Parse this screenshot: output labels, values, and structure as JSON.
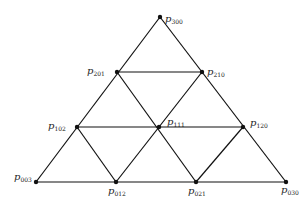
{
  "diagram": {
    "points": [
      {
        "id": "p300",
        "symbol": "p",
        "index": "300",
        "x": 160,
        "y": 17,
        "lx": 165,
        "ly": 21
      },
      {
        "id": "p201",
        "symbol": "p",
        "index": "201",
        "x": 117,
        "y": 72,
        "lx": 87,
        "ly": 72
      },
      {
        "id": "p210",
        "symbol": "p",
        "index": "210",
        "x": 202,
        "y": 72,
        "lx": 207,
        "ly": 73
      },
      {
        "id": "p102",
        "symbol": "p",
        "index": "102",
        "x": 77,
        "y": 127,
        "lx": 48,
        "ly": 128
      },
      {
        "id": "p111",
        "symbol": "p",
        "index": "111",
        "x": 159,
        "y": 127,
        "lx": 167,
        "ly": 124
      },
      {
        "id": "p120",
        "symbol": "p",
        "index": "120",
        "x": 243,
        "y": 127,
        "lx": 251,
        "ly": 125
      },
      {
        "id": "p003",
        "symbol": "p",
        "index": "003",
        "x": 36,
        "y": 182,
        "lx": 14,
        "ly": 179
      },
      {
        "id": "p012",
        "symbol": "p",
        "index": "012",
        "x": 116,
        "y": 182,
        "lx": 108,
        "ly": 194
      },
      {
        "id": "p021",
        "symbol": "p",
        "index": "021",
        "x": 196,
        "y": 182,
        "lx": 188,
        "ly": 194
      },
      {
        "id": "p030",
        "symbol": "p",
        "index": "030",
        "x": 286,
        "y": 182,
        "lx": 282,
        "ly": 193
      }
    ],
    "labels": {
      "p300": "p",
      "p300_sub": "300",
      "p201": "p",
      "p201_sub": "201",
      "p210": "p",
      "p210_sub": "210",
      "p102": "p",
      "p102_sub": "102",
      "p111": "p",
      "p111_sub": "111",
      "p120": "p",
      "p120_sub": "120",
      "p003": "p",
      "p003_sub": "003",
      "p012": "p",
      "p012_sub": "012",
      "p021": "p",
      "p021_sub": "021",
      "p030": "p",
      "p030_sub": "030"
    },
    "edges": [
      [
        "p300",
        "p201"
      ],
      [
        "p201",
        "p102"
      ],
      [
        "p102",
        "p003"
      ],
      [
        "p300",
        "p210"
      ],
      [
        "p210",
        "p120"
      ],
      [
        "p120",
        "p030"
      ],
      [
        "p003",
        "p012"
      ],
      [
        "p012",
        "p021"
      ],
      [
        "p021",
        "p030"
      ],
      [
        "p201",
        "p210"
      ],
      [
        "p102",
        "p111"
      ],
      [
        "p111",
        "p120"
      ],
      [
        "p201",
        "p111"
      ],
      [
        "p111",
        "p021"
      ],
      [
        "p210",
        "p111"
      ],
      [
        "p111",
        "p012"
      ],
      [
        "p102",
        "p012"
      ],
      [
        "p120",
        "p021"
      ]
    ]
  }
}
